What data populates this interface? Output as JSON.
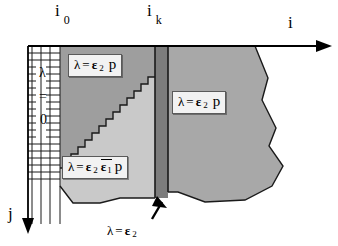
{
  "figure": {
    "background_color": "#ffffff",
    "width": 338,
    "height": 246
  },
  "axes": {
    "horizontal": {
      "name": "i-axis",
      "label": "i",
      "direction": "right",
      "arrow": true
    },
    "vertical": {
      "name": "j-axis",
      "label": "j",
      "direction": "down",
      "arrow": true
    }
  },
  "tick_labels": [
    {
      "name": "i-zero",
      "base": "i",
      "sub": "0"
    },
    {
      "name": "i-k",
      "base": "i",
      "sub": "k"
    }
  ],
  "grid": {
    "name": "lattice-grid",
    "label_lines": [
      "λ",
      "=",
      "0"
    ]
  },
  "regions": [
    {
      "name": "upper-left-region",
      "fill": "#9e9e9e",
      "label": {
        "lam": "λ",
        "eq": "=",
        "eps": "ε",
        "eps_sub": "2",
        "p": "p"
      }
    },
    {
      "name": "lower-left-region",
      "fill": "#c9c9c9",
      "label": {
        "lam": "λ",
        "eq": "=",
        "eps": "ε",
        "eps_sub": "2",
        "eps2": "ε",
        "eps2_sub": "1",
        "overline": true,
        "p": "p"
      }
    },
    {
      "name": "right-region",
      "fill": "#a8a8a8",
      "label": {
        "lam": "λ",
        "eq": "=",
        "eps": "ε",
        "eps_sub": "2",
        "p": "p"
      }
    },
    {
      "name": "interface-bar",
      "fill": "#7d7d7d"
    }
  ],
  "annotation": {
    "name": "interface-annotation",
    "lam": "λ",
    "eq": "=",
    "eps": "ε",
    "eps_sub": "2",
    "arrow": "up-arrow"
  },
  "colors": {
    "dark_gray": "#9e9e9e",
    "light_gray": "#c9c9c9",
    "right_gray": "#a8a8a8",
    "bar_gray": "#7d7d7d",
    "line": "#000000",
    "box_bg": "#f2f2f2"
  }
}
